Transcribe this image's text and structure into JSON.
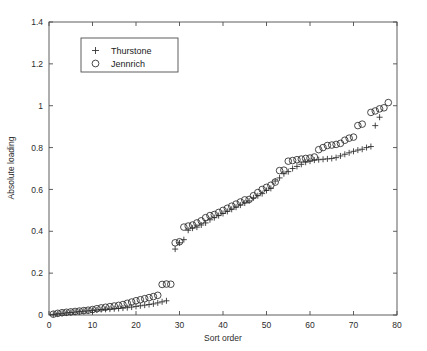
{
  "chart_data": {
    "type": "scatter",
    "title": "",
    "xlabel": "Sort order",
    "ylabel": "Absolute loading",
    "xlim": [
      0,
      80
    ],
    "ylim": [
      0,
      1.4
    ],
    "xticks": [
      0,
      10,
      20,
      30,
      40,
      50,
      60,
      70,
      80
    ],
    "xticklabels": [
      "0",
      "10",
      "20",
      "30",
      "40",
      "50",
      "60",
      "70",
      "80"
    ],
    "yticks": [
      0,
      0.2,
      0.4,
      0.6,
      0.8,
      1.0,
      1.2,
      1.4
    ],
    "yticklabels": [
      "0",
      "0.2",
      "0.4",
      "0.6",
      "0.8",
      "1",
      "1.2",
      "1.4"
    ],
    "grid": false,
    "box": true,
    "tick_direction": "in",
    "legend": {
      "position": "upper-left-inset",
      "entries": [
        {
          "name": "Thurstone",
          "marker": "plus-marker",
          "color": "#2b2b2b"
        },
        {
          "name": "Jennrich",
          "marker": "circle-marker",
          "color": "#2b2b2b"
        }
      ]
    },
    "series": [
      {
        "name": "Thurstone",
        "marker": "plus-marker",
        "color": "#2b2b2b",
        "x": [
          1,
          2,
          3,
          4,
          5,
          6,
          7,
          8,
          9,
          10,
          11,
          12,
          13,
          14,
          15,
          16,
          17,
          18,
          19,
          20,
          21,
          22,
          23,
          24,
          25,
          26,
          27,
          29,
          30,
          31,
          32,
          33,
          34,
          35,
          36,
          37,
          38,
          39,
          40,
          41,
          42,
          43,
          44,
          45,
          46,
          47,
          48,
          49,
          50,
          51,
          52,
          53,
          54,
          55,
          56,
          57,
          58,
          59,
          60,
          61,
          62,
          63,
          64,
          65,
          66,
          67,
          68,
          69,
          70,
          71,
          72,
          73,
          74,
          75,
          76
        ],
        "y": [
          0.003,
          0.006,
          0.008,
          0.01,
          0.012,
          0.014,
          0.016,
          0.018,
          0.02,
          0.022,
          0.024,
          0.026,
          0.027,
          0.028,
          0.03,
          0.031,
          0.033,
          0.035,
          0.038,
          0.041,
          0.044,
          0.047,
          0.05,
          0.053,
          0.058,
          0.063,
          0.068,
          0.315,
          0.345,
          0.36,
          0.405,
          0.415,
          0.42,
          0.43,
          0.44,
          0.455,
          0.465,
          0.475,
          0.485,
          0.495,
          0.505,
          0.515,
          0.525,
          0.535,
          0.545,
          0.56,
          0.57,
          0.58,
          0.595,
          0.605,
          0.64,
          0.655,
          0.675,
          0.685,
          0.7,
          0.71,
          0.72,
          0.73,
          0.735,
          0.74,
          0.742,
          0.744,
          0.746,
          0.748,
          0.752,
          0.76,
          0.768,
          0.775,
          0.782,
          0.788,
          0.792,
          0.8,
          0.805,
          0.905,
          0.945
        ]
      },
      {
        "name": "Jennrich",
        "marker": "circle-marker",
        "color": "#2b2b2b",
        "x": [
          1,
          2,
          3,
          4,
          5,
          6,
          7,
          8,
          9,
          10,
          11,
          12,
          13,
          14,
          15,
          16,
          17,
          18,
          19,
          20,
          21,
          22,
          23,
          24,
          25,
          26,
          27,
          28,
          29,
          30,
          31,
          32,
          33,
          34,
          35,
          36,
          37,
          38,
          39,
          40,
          41,
          42,
          43,
          44,
          45,
          46,
          47,
          48,
          49,
          50,
          51,
          52,
          53,
          54,
          55,
          56,
          57,
          58,
          59,
          60,
          61,
          62,
          63,
          64,
          65,
          66,
          67,
          68,
          69,
          70,
          71,
          72,
          74,
          75,
          76,
          77,
          78
        ],
        "y": [
          0.004,
          0.008,
          0.011,
          0.013,
          0.015,
          0.017,
          0.019,
          0.021,
          0.023,
          0.026,
          0.03,
          0.034,
          0.037,
          0.04,
          0.043,
          0.046,
          0.05,
          0.056,
          0.062,
          0.068,
          0.073,
          0.078,
          0.083,
          0.088,
          0.094,
          0.146,
          0.148,
          0.147,
          0.345,
          0.35,
          0.42,
          0.425,
          0.43,
          0.44,
          0.45,
          0.465,
          0.475,
          0.48,
          0.49,
          0.5,
          0.51,
          0.52,
          0.53,
          0.54,
          0.55,
          0.552,
          0.57,
          0.585,
          0.6,
          0.61,
          0.62,
          0.635,
          0.69,
          0.692,
          0.735,
          0.738,
          0.742,
          0.745,
          0.748,
          0.75,
          0.755,
          0.79,
          0.8,
          0.81,
          0.812,
          0.815,
          0.82,
          0.835,
          0.845,
          0.85,
          0.905,
          0.912,
          0.968,
          0.975,
          0.985,
          0.99,
          1.015
        ]
      }
    ]
  }
}
